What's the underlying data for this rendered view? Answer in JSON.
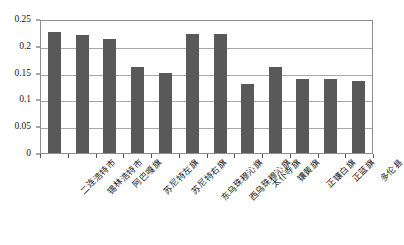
{
  "chart_data": {
    "type": "bar",
    "title": "",
    "subtitle": "",
    "xlabel": "",
    "ylabel": "",
    "ylim": [
      0,
      0.25
    ],
    "ytick_labels": [
      "0.25",
      "0.2",
      "0.15",
      "0.1",
      "0.05",
      "0"
    ],
    "ytick_values": [
      0.25,
      0.2,
      0.15,
      0.1,
      0.05,
      0
    ],
    "grid": true,
    "legend": false,
    "legend_position": "none",
    "bar_color": "#595959",
    "plot_border_color": "#8f8f8f",
    "gridline_color": "#a8a8a8",
    "categories": [
      "二连浩特市",
      "锡林浩特市",
      "阿巴嘎旗",
      "苏尼特左旗",
      "苏尼特右旗",
      "东乌珠穆沁旗",
      "西乌珠穆沁旗",
      "太仆寺旗",
      "镶黄旗",
      "正镶白旗",
      "正蓝旗",
      "多伦县"
    ],
    "values": [
      0.226,
      0.22,
      0.212,
      0.16,
      0.15,
      0.222,
      0.222,
      0.128,
      0.16,
      0.139,
      0.139,
      0.134
    ]
  }
}
